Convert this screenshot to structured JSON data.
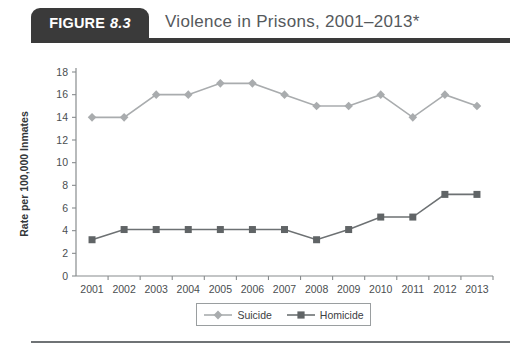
{
  "header": {
    "badge_word": "FIGURE",
    "badge_number": "8.3",
    "title": "Violence in Prisons, 2001–2013*"
  },
  "colors": {
    "badge_background": "#3a3a3a",
    "header_rule": "#3a3a3a",
    "title_text": "#55595c",
    "suicide": "#a9acae",
    "homicide": "#606466",
    "axis": "#888c8e",
    "footer_rule": "#6f7375"
  },
  "legend": {
    "entries": [
      {
        "label": "Suicide",
        "marker": "diamond-marker",
        "color": "#a9acae"
      },
      {
        "label": "Homicide",
        "marker": "square-marker",
        "color": "#606466"
      }
    ]
  },
  "chart_data": {
    "type": "line",
    "title": "Violence in Prisons, 2001–2013*",
    "xlabel": "",
    "ylabel": "Rate per 100,000 Inmates",
    "categories": [
      "2001",
      "2002",
      "2003",
      "2004",
      "2005",
      "2006",
      "2007",
      "2008",
      "2009",
      "2010",
      "2011",
      "2012",
      "2013"
    ],
    "x_tick_labels": [
      "2001",
      "2002",
      "2003",
      "2004",
      "2005",
      "2006",
      "2007",
      "2008",
      "2009",
      "2010",
      "2011",
      "2012",
      "2013"
    ],
    "y_tick_labels": [
      "0",
      "2",
      "4",
      "6",
      "8",
      "10",
      "12",
      "14",
      "16",
      "18"
    ],
    "y_ticks": [
      0,
      2,
      4,
      6,
      8,
      10,
      12,
      14,
      16,
      18
    ],
    "ylim": [
      0,
      18
    ],
    "grid": false,
    "legend_position": "bottom",
    "series": [
      {
        "name": "Suicide",
        "marker": "diamond",
        "color": "#a9acae",
        "values": [
          14,
          14,
          16,
          16,
          17,
          17,
          16,
          15,
          15,
          16,
          14,
          16,
          15
        ]
      },
      {
        "name": "Homicide",
        "marker": "square",
        "color": "#606466",
        "values": [
          3.2,
          4.1,
          4.1,
          4.1,
          4.1,
          4.1,
          4.1,
          3.2,
          4.1,
          5.2,
          5.2,
          7.2,
          7.2
        ]
      }
    ]
  }
}
